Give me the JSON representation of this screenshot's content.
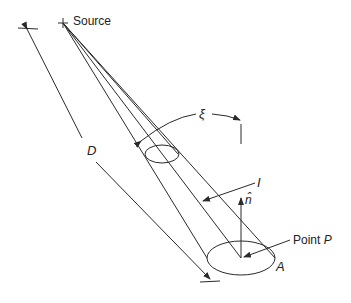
{
  "diagram": {
    "labels": {
      "source": "Source",
      "distance": "D",
      "angle": "ξ",
      "intensity": "I",
      "normal": "n̂",
      "point_prefix": "Point",
      "point_name": "P",
      "area": "A"
    },
    "colors": {
      "stroke": "#2a2a2a",
      "text": "#222222"
    }
  }
}
